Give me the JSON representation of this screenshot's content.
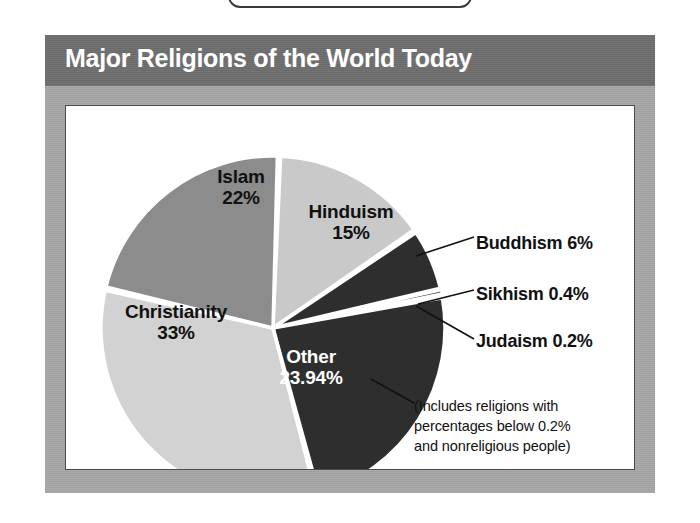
{
  "figure": {
    "title": "Major Religions of the World Today",
    "title_bar_color": "#6e6e6e",
    "frame_color": "#a6a6a6",
    "panel_background": "#ffffff"
  },
  "chart_data": {
    "type": "pie",
    "title": "Major Religions of the World Today",
    "xlabel": "",
    "ylabel": "",
    "legend_position": "labels-on-slices",
    "grid": false,
    "categories": [
      "Hinduism",
      "Buddhism",
      "Sikhism",
      "Judaism",
      "Other",
      "Christianity",
      "Islam"
    ],
    "values": [
      15,
      6,
      0.4,
      0.2,
      23.94,
      33,
      22
    ],
    "slices": [
      {
        "label": "Hinduism",
        "value": 15,
        "value_text": "15%",
        "color": "#c9c9c9",
        "text_color": "#111111",
        "label_placement": "inside"
      },
      {
        "label": "Buddhism",
        "value": 6,
        "value_text": "6%",
        "color": "#2e2e2e",
        "text_color": "#111111",
        "label_placement": "callout"
      },
      {
        "label": "Sikhism",
        "value": 0.4,
        "value_text": "0.4%",
        "color": "#2e2e2e",
        "text_color": "#111111",
        "label_placement": "callout"
      },
      {
        "label": "Judaism",
        "value": 0.2,
        "value_text": "0.2%",
        "color": "#2e2e2e",
        "text_color": "#111111",
        "label_placement": "callout"
      },
      {
        "label": "Other",
        "value": 23.94,
        "value_text": "23.94%",
        "color": "#2e2e2e",
        "text_color": "#ffffff",
        "label_placement": "inside"
      },
      {
        "label": "Christianity",
        "value": 33,
        "value_text": "33%",
        "color": "#d2d2d2",
        "text_color": "#111111",
        "label_placement": "inside"
      },
      {
        "label": "Islam",
        "value": 22,
        "value_text": "22%",
        "color": "#8c8c8c",
        "text_color": "#111111",
        "label_placement": "inside"
      }
    ],
    "annotations": [
      "(Includes religions with",
      "percentages below 0.2%",
      "and nonreligious people)"
    ]
  },
  "labels": {
    "islam": {
      "name": "Islam",
      "pct": "22%"
    },
    "hinduism": {
      "name": "Hinduism",
      "pct": "15%"
    },
    "christianity": {
      "name": "Christianity",
      "pct": "33%"
    },
    "other": {
      "name": "Other",
      "pct": "23.94%"
    },
    "buddhism": {
      "text": "Buddhism 6%"
    },
    "sikhism": {
      "text": "Sikhism 0.4%"
    },
    "judaism": {
      "text": "Judaism 0.2%"
    }
  },
  "footnote": {
    "line1": "(Includes religions with",
    "line2": "percentages below 0.2%",
    "line3": "and nonreligious people)"
  }
}
